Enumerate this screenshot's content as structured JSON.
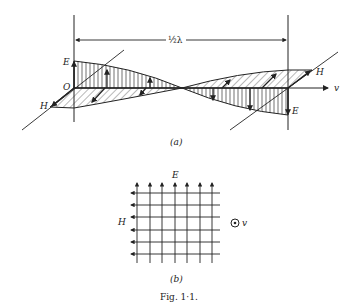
{
  "figure": {
    "caption": "Fig. 1·1.",
    "panel_a": {
      "label": "(a)",
      "dimension_label": "½λ",
      "E_left_label": "E",
      "origin_label": "O",
      "H_left_label": "H",
      "H_right_label": "H",
      "E_right_label": "E",
      "propagation_label": "v"
    },
    "panel_b": {
      "label": "(b)",
      "E_label": "E",
      "H_label": "H",
      "propagation_label": "v",
      "propagation_symbol": "⊙",
      "grid_vertical_lines": 7,
      "grid_horizontal_lines": 6
    }
  },
  "colors": {
    "ink": "#222222",
    "background": "#ffffff"
  }
}
